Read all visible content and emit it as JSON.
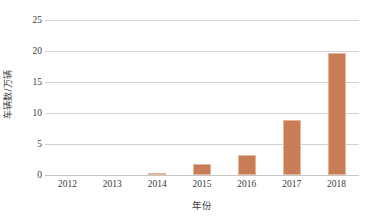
{
  "chart_data": {
    "type": "bar",
    "title": "",
    "subtitle": "",
    "xlabel": "年份",
    "ylabel": "车辆数/万辆",
    "categories": [
      "2012",
      "2013",
      "2014",
      "2015",
      "2016",
      "2017",
      "2018"
    ],
    "values": [
      0,
      0,
      0.15,
      1.8,
      3.2,
      8.8,
      19.7
    ],
    "series": [
      {
        "name": "车辆数",
        "values": [
          0,
          0,
          0.15,
          1.8,
          3.2,
          8.8,
          19.7
        ]
      }
    ],
    "ylim": [
      0,
      25
    ],
    "ytick_values": [
      0,
      5,
      10,
      15,
      20,
      25
    ],
    "ytick_labels": [
      "0",
      "5",
      "10",
      "15",
      "20",
      "25"
    ],
    "xtick_labels": [
      "2012",
      "2013",
      "2014",
      "2015",
      "2016",
      "2017",
      "2018"
    ],
    "grid": "horizontal",
    "legend": "none",
    "bar_color": "#c97d56",
    "gridline_color": "#d2d2d2",
    "axis_text_color": "#3a3a3a"
  }
}
